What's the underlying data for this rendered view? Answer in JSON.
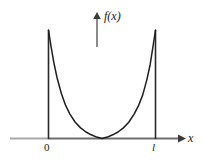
{
  "figure": {
    "background_color": "#ffffff",
    "ink_color": "#1a1a1a",
    "axis_color": "#7d7d7d",
    "vertical_axis": {
      "name": "f-of-x-axis",
      "label": "f(x)",
      "arrow": "up-arrow-icon"
    },
    "horizontal_axis": {
      "name": "x-axis",
      "label": "x",
      "arrow": "right-arrow-icon"
    },
    "tick_labels": [
      {
        "text": "0",
        "position": "left-wall"
      },
      {
        "text": "l",
        "position": "right-wall"
      }
    ],
    "walls": [
      {
        "name": "left-wall",
        "x_label": "0"
      },
      {
        "name": "right-wall",
        "x_label": "l"
      }
    ],
    "curve": {
      "name": "potential-well-curve",
      "style": "solid",
      "shape": "u-shaped"
    }
  },
  "chart_data": {
    "type": "line",
    "title": "",
    "xlabel": "x",
    "ylabel": "f(x)",
    "xlim": [
      0,
      1
    ],
    "ylim": [
      0,
      1
    ],
    "grid": false,
    "legend": null,
    "xtick_labels": [
      "0",
      "l"
    ],
    "xticks": [
      0,
      1
    ],
    "ytick_labels": [],
    "annotations": [
      "f(x)",
      "x",
      "0",
      "l"
    ],
    "series": [
      {
        "name": "f(x)",
        "comment": "U-shaped curve rising steeply to infinity at both walls",
        "x": [
          0.0,
          0.02,
          0.05,
          0.08,
          0.12,
          0.16,
          0.2,
          0.25,
          0.3,
          0.35,
          0.4,
          0.45,
          0.5,
          0.55,
          0.6,
          0.65,
          0.7,
          0.75,
          0.8,
          0.84,
          0.88,
          0.92,
          0.95,
          0.98,
          1.0
        ],
        "y": [
          1.0,
          0.87,
          0.7,
          0.56,
          0.415,
          0.305,
          0.225,
          0.15,
          0.098,
          0.06,
          0.034,
          0.013,
          0.0,
          0.013,
          0.034,
          0.06,
          0.098,
          0.15,
          0.225,
          0.3,
          0.4,
          0.545,
          0.68,
          0.87,
          1.0
        ]
      },
      {
        "name": "left-wall",
        "comment": "vertical line at x=0",
        "x": [
          0,
          0
        ],
        "y": [
          0,
          1
        ]
      },
      {
        "name": "right-wall",
        "comment": "vertical line at x=l",
        "x": [
          1,
          1
        ],
        "y": [
          0,
          1
        ]
      }
    ]
  }
}
